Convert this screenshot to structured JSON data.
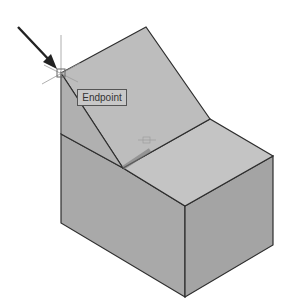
{
  "viewport": {
    "background": "#ffffff"
  },
  "model": {
    "name": "isometric-solid-block-with-sloped-face",
    "colors": {
      "left_face": "#a9a9a9",
      "front_face": "#a4a4a4",
      "top_face": "#c4c4c4",
      "slope_face": "#bdbdbd",
      "slope_side": "#b0b0b0",
      "edge": "#2e2e2e"
    }
  },
  "snap": {
    "marker": "endpoint-snap-marker",
    "x": 61,
    "y": 73,
    "tooltip": "Endpoint"
  },
  "pointer": {
    "icon": "arrow-pointer-icon",
    "color": "#222222"
  },
  "cursor": {
    "icon": "crosshair-cursor-icon"
  }
}
